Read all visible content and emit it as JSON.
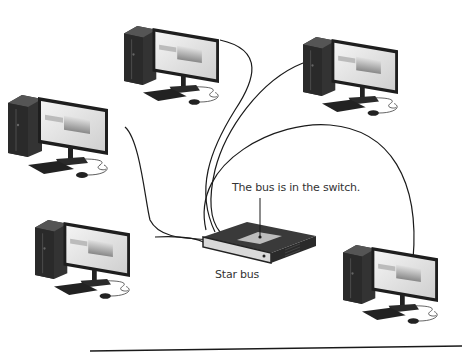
{
  "diagram": {
    "title": "Star bus",
    "callout": "The bus is in the switch.",
    "type": "network-topology",
    "hub": {
      "name": "switch",
      "shape": "network-switch"
    },
    "nodes": [
      {
        "id": "pc-top-center",
        "icon": "desktop-computer-icon"
      },
      {
        "id": "pc-top-right",
        "icon": "desktop-computer-icon"
      },
      {
        "id": "pc-left",
        "icon": "desktop-computer-icon"
      },
      {
        "id": "pc-bottom-left",
        "icon": "desktop-computer-icon"
      },
      {
        "id": "pc-bottom-right",
        "icon": "desktop-computer-icon"
      }
    ],
    "colors": {
      "line": "#1a1a1a",
      "tower": "#2b2b2b",
      "screen": "#e8e8e8",
      "background": "#ffffff"
    }
  }
}
